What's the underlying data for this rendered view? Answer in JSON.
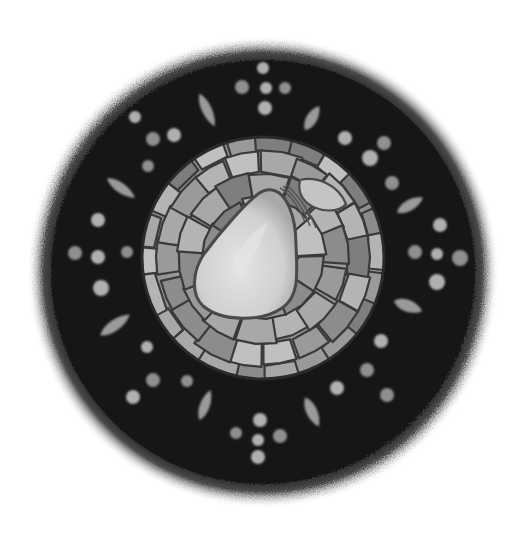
{
  "image": {
    "subject": "Circular mosaic plate with pear motif",
    "style": "grayscale illustration",
    "width": 526,
    "height": 537,
    "background": "#ffffff"
  },
  "plate": {
    "center": [
      263,
      272
    ],
    "outer_radius": 222,
    "ring_color": "#141414",
    "edge_halo_color": "#8a8a8a"
  },
  "mosaic_disc": {
    "center": [
      263,
      258
    ],
    "radius": 121,
    "grout_color": "#3a3a3a",
    "tile_shades": [
      "#9a9a9a",
      "#a8a8a8",
      "#b4b4b4",
      "#8c8c8c",
      "#c0c0c0",
      "#7e7e7e"
    ]
  },
  "pear": {
    "fill": "#d2d2d2",
    "highlight": "#e2e2e2",
    "outline": "#4a4a4a",
    "stem_color": "#555555"
  },
  "ring_ornaments": {
    "dot_color": "#8f8f8f",
    "dot_light": "#b0b0b0",
    "leaf_color": "#9a9a9a",
    "rosettes": [
      {
        "name": "top",
        "dots": [
          [
            263,
            68,
            6
          ],
          [
            242,
            87,
            7
          ],
          [
            266,
            88,
            6
          ],
          [
            285,
            88,
            6
          ],
          [
            265,
            108,
            7
          ]
        ]
      },
      {
        "name": "left",
        "dots": [
          [
            98,
            220,
            7
          ],
          [
            75,
            253,
            7
          ],
          [
            98,
            257,
            7
          ],
          [
            127,
            252,
            6
          ],
          [
            101,
            288,
            8
          ]
        ]
      },
      {
        "name": "right",
        "dots": [
          [
            440,
            225,
            7
          ],
          [
            415,
            252,
            7
          ],
          [
            437,
            254,
            6
          ],
          [
            460,
            258,
            8
          ],
          [
            437,
            282,
            8
          ]
        ]
      },
      {
        "name": "bottom",
        "dots": [
          [
            260,
            420,
            7
          ],
          [
            236,
            433,
            6
          ],
          [
            258,
            440,
            6
          ],
          [
            280,
            436,
            7
          ],
          [
            258,
            457,
            7
          ]
        ]
      },
      {
        "name": "upper-left",
        "dots": [
          [
            135,
            117,
            6
          ],
          [
            153,
            139,
            7
          ],
          [
            174,
            135,
            7
          ],
          [
            148,
            166,
            6
          ]
        ]
      },
      {
        "name": "upper-right",
        "dots": [
          [
            345,
            138,
            7
          ],
          [
            384,
            143,
            7
          ],
          [
            370,
            158,
            8
          ],
          [
            392,
            183,
            7
          ]
        ]
      },
      {
        "name": "lower-left",
        "dots": [
          [
            147,
            347,
            6
          ],
          [
            153,
            380,
            7
          ],
          [
            133,
            397,
            7
          ],
          [
            187,
            381,
            6
          ]
        ]
      },
      {
        "name": "lower-right",
        "dots": [
          [
            381,
            341,
            7
          ],
          [
            367,
            370,
            7
          ],
          [
            337,
            388,
            7
          ],
          [
            387,
            395,
            7
          ]
        ]
      }
    ],
    "leaves": [
      {
        "cx": 207,
        "cy": 110,
        "len": 36,
        "w": 9,
        "angle": 65
      },
      {
        "cx": 312,
        "cy": 118,
        "len": 28,
        "w": 10,
        "angle": -60
      },
      {
        "cx": 121,
        "cy": 188,
        "len": 34,
        "w": 9,
        "angle": 35
      },
      {
        "cx": 410,
        "cy": 205,
        "len": 30,
        "w": 10,
        "angle": -30
      },
      {
        "cx": 115,
        "cy": 325,
        "len": 36,
        "w": 10,
        "angle": -35
      },
      {
        "cx": 408,
        "cy": 306,
        "len": 30,
        "w": 11,
        "angle": 20
      },
      {
        "cx": 205,
        "cy": 405,
        "len": 32,
        "w": 9,
        "angle": -70
      },
      {
        "cx": 312,
        "cy": 412,
        "len": 32,
        "w": 10,
        "angle": 65
      }
    ]
  }
}
